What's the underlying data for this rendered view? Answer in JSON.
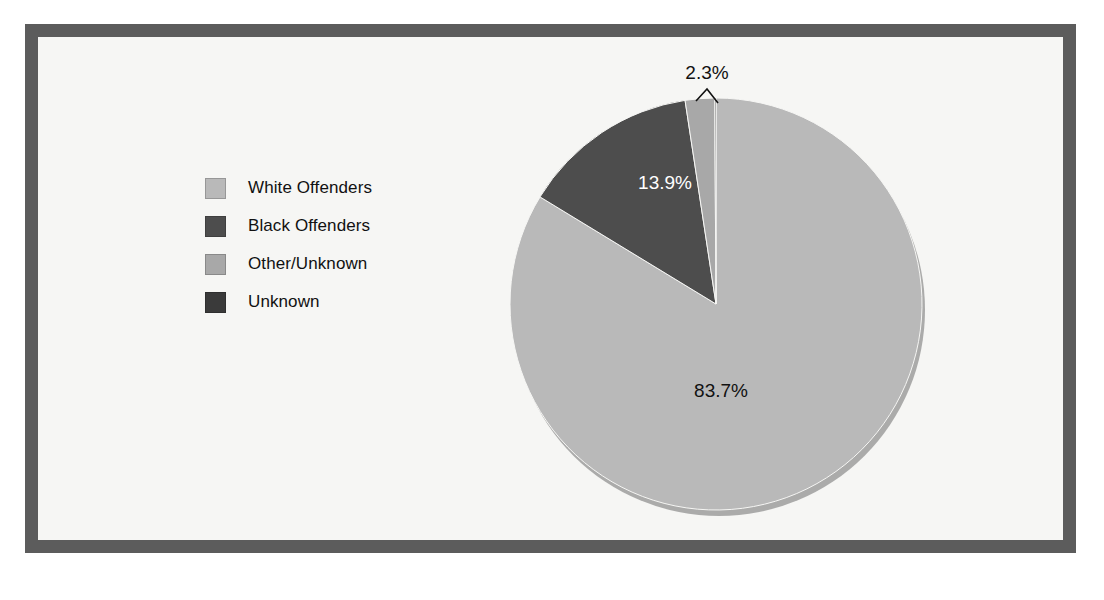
{
  "figure": {
    "frame_color": "#5c5c5c",
    "plot_background": "#f6f6f4"
  },
  "legend": {
    "items": [
      {
        "label": "White Offenders",
        "color": "#b9b9b9"
      },
      {
        "label": "Black Offenders",
        "color": "#4d4d4d"
      },
      {
        "label": "Other/Unknown",
        "color": "#a8a8a8"
      },
      {
        "label": "Unknown",
        "color": "#3a3a3a"
      }
    ]
  },
  "chart_data": {
    "type": "pie",
    "title": "",
    "categories": [
      "White Offenders",
      "Black Offenders",
      "Other/Unknown",
      "Unknown"
    ],
    "values": [
      83.7,
      13.9,
      2.3,
      0.1
    ],
    "value_labels": [
      "83.7%",
      "13.9%",
      "2.3%",
      ""
    ],
    "colors": [
      "#b9b9b9",
      "#4d4d4d",
      "#a8a8a8",
      "#3a3a3a"
    ],
    "units": "percent",
    "legend_position": "left",
    "grid": false,
    "label_positions": [
      {
        "label": "83.7%",
        "x": 721,
        "y": 397,
        "style": "dark"
      },
      {
        "label": "13.9%",
        "x": 665,
        "y": 189,
        "style": "light"
      },
      {
        "label": "2.3%",
        "x": 707,
        "y": 79,
        "style": "dark",
        "leader": true
      }
    ]
  },
  "geometry": {
    "center_x": 716,
    "center_y": 304,
    "radius": 206,
    "start_angle_deg": -90
  }
}
